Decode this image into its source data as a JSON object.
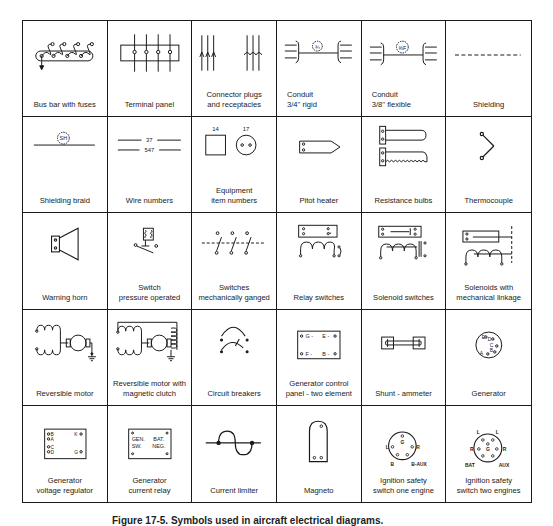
{
  "figure": {
    "caption": "Figure 17-5. Symbols used in aircraft electrical diagrams.",
    "grid": {
      "columns": 6,
      "rows": 5
    }
  },
  "symbols": [
    {
      "label": "Bus bar with fuses",
      "icon": "bus-bar-with-fuses"
    },
    {
      "label": "Terminal panel",
      "icon": "terminal-panel"
    },
    {
      "label": "Connector plugs\nand receptacles",
      "icon": "connector-plugs-receptacles"
    },
    {
      "label": "Conduit\n3/4''  rigid",
      "icon": "conduit-rigid",
      "tag": "¾"
    },
    {
      "label": "Conduit\n3/8'' flexible",
      "icon": "conduit-flexible",
      "tag": "⅜F"
    },
    {
      "label": "Shielding",
      "icon": "shielding"
    },
    {
      "label": "Shielding braid",
      "icon": "shielding-braid",
      "tag": "SH"
    },
    {
      "label": "Wire numbers",
      "icon": "wire-numbers",
      "numbers": [
        "37",
        "547"
      ]
    },
    {
      "label": "Equipment\nitem numbers",
      "icon": "equipment-item-numbers",
      "numbers": [
        "14",
        "17"
      ]
    },
    {
      "label": "Pitot heater",
      "icon": "pitot-heater"
    },
    {
      "label": "Resistance bulbs",
      "icon": "resistance-bulbs"
    },
    {
      "label": "Thermocouple",
      "icon": "thermocouple"
    },
    {
      "label": "Warning horn",
      "icon": "warning-horn"
    },
    {
      "label": "Switch\npressure operated",
      "icon": "switch-pressure-operated"
    },
    {
      "label": "Switches\nmechanically ganged",
      "icon": "switches-mechanically-ganged"
    },
    {
      "label": "Relay switches",
      "icon": "relay-switches"
    },
    {
      "label": "Solenoid switches",
      "icon": "solenoid-switches"
    },
    {
      "label": "Solenoids with\nmechanical linkage",
      "icon": "solenoids-mechanical-linkage"
    },
    {
      "label": "Reversible motor",
      "icon": "reversible-motor"
    },
    {
      "label": "Reversible motor with\nmagnetic clutch",
      "icon": "reversible-motor-clutch"
    },
    {
      "label": "Circuit breakers",
      "icon": "circuit-breakers"
    },
    {
      "label": "Generator control\npanel - two element",
      "icon": "generator-control-panel",
      "terminals": [
        "G",
        "E",
        "F",
        "B"
      ]
    },
    {
      "label": "Shunt - ammeter",
      "icon": "shunt-ammeter"
    },
    {
      "label": "Generator",
      "icon": "generator",
      "terminals": [
        "E",
        "D",
        "C",
        "B",
        "A"
      ]
    },
    {
      "label": "Generator\nvoltage regulator",
      "icon": "generator-voltage-regulator",
      "terminals": [
        "B",
        "A",
        "C",
        "D",
        "K",
        "G"
      ]
    },
    {
      "label": "Generator\ncurrent relay",
      "icon": "generator-current-relay",
      "terminals": [
        "GEN.",
        "BAT.",
        "SW.",
        "NEG."
      ]
    },
    {
      "label": "Current limiter",
      "icon": "current-limiter"
    },
    {
      "label": "Magneto",
      "icon": "magneto"
    },
    {
      "label": "Ignition safety\nswitch one engine",
      "icon": "ignition-switch-one-engine",
      "terminals": [
        "G",
        "L",
        "R",
        "B",
        "B-AUX"
      ]
    },
    {
      "label": "Ignition safety\nswitch two engines",
      "icon": "ignition-switch-two-engines",
      "terminals": [
        "L",
        "L",
        "R",
        "G",
        "R",
        "BAT",
        "AUX"
      ]
    }
  ]
}
